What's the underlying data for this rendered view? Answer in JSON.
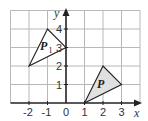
{
  "diagram": {
    "type": "coordinate-grid",
    "grid": {
      "x_min": -3,
      "x_max": 4,
      "y_min": 0,
      "y_max": 5,
      "unit_px": 18.5,
      "origin_px": [
        66,
        103
      ]
    },
    "axes": {
      "x_label": "x",
      "y_label": "y",
      "x_ticks": [
        "-2",
        "-1",
        "0",
        "1",
        "2",
        "3"
      ],
      "y_ticks": [
        "1",
        "2",
        "3",
        "4"
      ]
    },
    "shapes": [
      {
        "name": "P",
        "label": "P",
        "subscript": "",
        "vertices": [
          [
            1,
            0
          ],
          [
            2,
            2
          ],
          [
            3,
            1
          ]
        ],
        "fill": "#e0e0e0"
      },
      {
        "name": "P1",
        "label": "P",
        "subscript": "1",
        "vertices": [
          [
            -2,
            2
          ],
          [
            -1,
            4
          ],
          [
            0,
            3
          ]
        ],
        "fill": "#ffffff"
      }
    ],
    "colors": {
      "grid": "#b8b8b8",
      "axis": "#222222",
      "stroke": "#222222"
    }
  }
}
